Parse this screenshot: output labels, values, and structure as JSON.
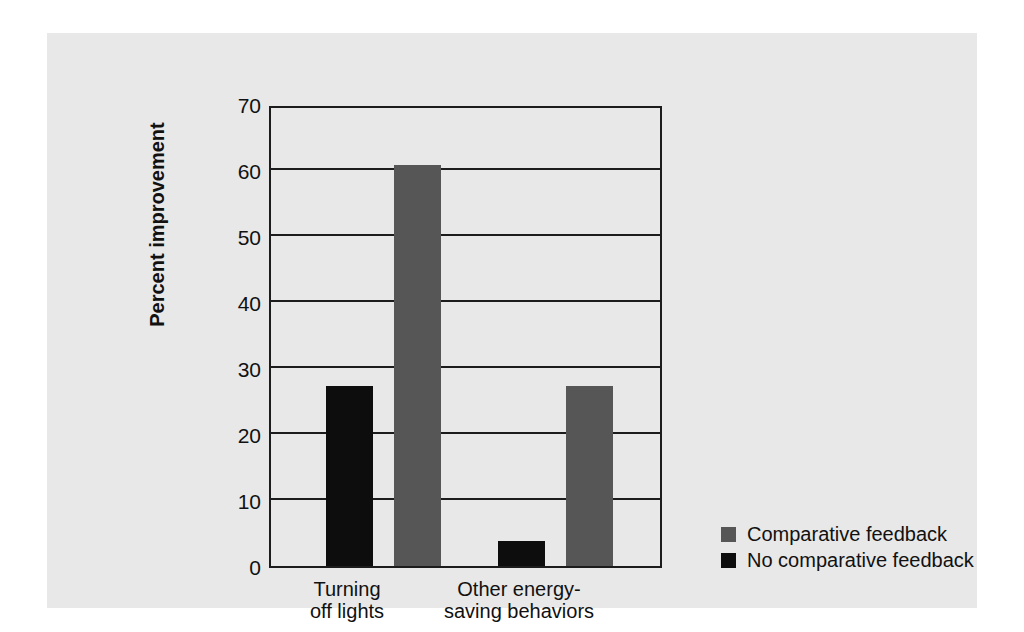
{
  "chart_data": {
    "type": "bar",
    "title": "",
    "xlabel": "",
    "ylabel": "Percent improvement",
    "categories": [
      "Turning\noff lights",
      "Other energy-\nsaving behaviors"
    ],
    "category_lines": [
      [
        "Turning",
        "off lights"
      ],
      [
        "Other energy-",
        "saving behaviors"
      ]
    ],
    "series": [
      {
        "name": "No comparative feedback",
        "color": "#0d0d0d",
        "values": [
          27.3,
          3.8
        ]
      },
      {
        "name": "Comparative feedback",
        "color": "#565656",
        "values": [
          60.8,
          27.3
        ]
      }
    ],
    "series_draw_order": [
      "No comparative feedback",
      "Comparative feedback"
    ],
    "ylim": [
      0,
      70
    ],
    "yticks": [
      0,
      10,
      20,
      30,
      40,
      50,
      60,
      70
    ],
    "ytick_labels": [
      "0",
      "10",
      "20",
      "30",
      "40",
      "50",
      "60",
      "70"
    ],
    "grid": true,
    "grid_axis": "y",
    "legend_position": "right-bottom-outside",
    "legend_entries": [
      {
        "label": "Comparative feedback",
        "color": "#565656"
      },
      {
        "label": "No comparative feedback",
        "color": "#0d0d0d"
      }
    ],
    "colors": {
      "panel_background": "#e8e8e8",
      "page_background": "#ffffff",
      "axis": "#1c1c1c",
      "text": "#111111"
    }
  }
}
